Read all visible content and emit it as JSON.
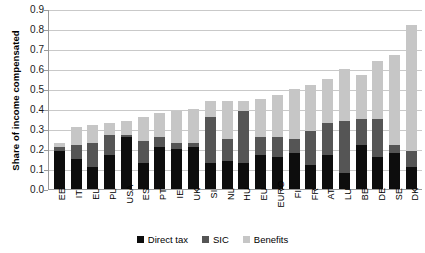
{
  "chart_data": {
    "type": "bar",
    "stacked": true,
    "title": "",
    "xlabel": "",
    "ylabel": "Share of income compensated",
    "ylim": [
      0,
      0.9
    ],
    "ytick_labels": [
      "0.9",
      "0.8",
      "0.7",
      "0.6",
      "0.5",
      "0.4",
      "0.3",
      "0.2",
      "0.1",
      "0.0"
    ],
    "ytick_values": [
      0.9,
      0.8,
      0.7,
      0.6,
      0.5,
      0.4,
      0.3,
      0.2,
      0.1,
      0.0
    ],
    "grid": true,
    "legend_position": "bottom",
    "categories": [
      "EE",
      "IT",
      "EL",
      "PL",
      "USA",
      "ES",
      "PT",
      "IE",
      "UK",
      "SI",
      "NL",
      "HU",
      "EU",
      "EURO",
      "FI",
      "FR",
      "AT",
      "LU",
      "BE",
      "DE",
      "SE",
      "DK"
    ],
    "series": [
      {
        "name": "Direct tax",
        "color": "#0d0d0d",
        "values": [
          0.19,
          0.15,
          0.11,
          0.17,
          0.26,
          0.13,
          0.21,
          0.2,
          0.21,
          0.13,
          0.14,
          0.13,
          0.17,
          0.16,
          0.18,
          0.12,
          0.17,
          0.08,
          0.22,
          0.16,
          0.18,
          0.11
        ]
      },
      {
        "name": "SIC",
        "color": "#555555",
        "values": [
          0.02,
          0.07,
          0.12,
          0.1,
          0.01,
          0.11,
          0.05,
          0.03,
          0.02,
          0.23,
          0.11,
          0.26,
          0.09,
          0.1,
          0.07,
          0.17,
          0.16,
          0.26,
          0.13,
          0.19,
          0.04,
          0.08
        ]
      },
      {
        "name": "Benefits",
        "color": "#c6c6c6",
        "values": [
          0.02,
          0.09,
          0.09,
          0.06,
          0.07,
          0.12,
          0.12,
          0.16,
          0.17,
          0.08,
          0.19,
          0.05,
          0.19,
          0.21,
          0.25,
          0.23,
          0.22,
          0.26,
          0.22,
          0.29,
          0.45,
          0.63
        ]
      }
    ],
    "totals": [
      0.23,
      0.31,
      0.32,
      0.33,
      0.34,
      0.36,
      0.38,
      0.39,
      0.4,
      0.44,
      0.44,
      0.44,
      0.45,
      0.47,
      0.5,
      0.52,
      0.55,
      0.6,
      0.57,
      0.64,
      0.67,
      0.82
    ]
  },
  "legend": {
    "items": [
      {
        "label": "Direct tax"
      },
      {
        "label": "SIC"
      },
      {
        "label": "Benefits"
      }
    ]
  }
}
